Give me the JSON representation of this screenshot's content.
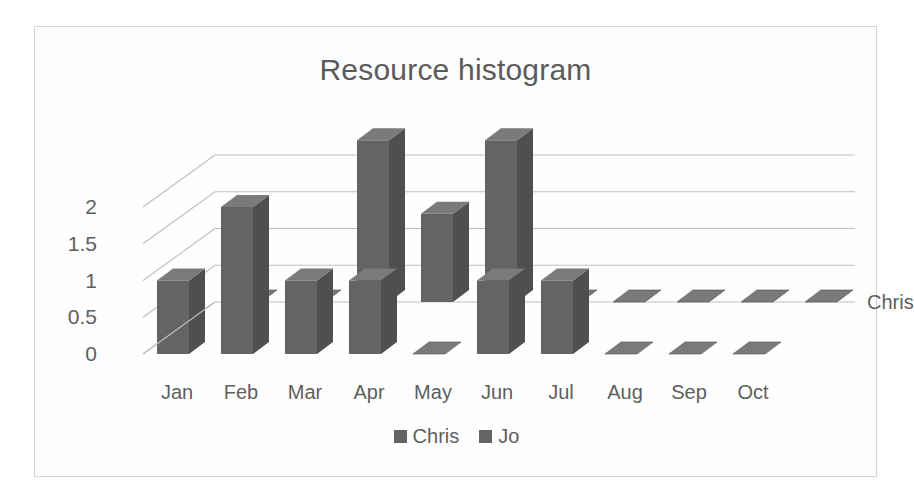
{
  "chart_data": {
    "type": "bar",
    "title": "Resource histogram",
    "subtitle": "",
    "xlabel": "",
    "ylabel": "",
    "categories": [
      "Jan",
      "Feb",
      "Mar",
      "Apr",
      "May",
      "Jun",
      "Jul",
      "Aug",
      "Sep",
      "Oct"
    ],
    "series": [
      {
        "name": "Chris",
        "values": [
          1,
          2,
          1,
          1,
          0,
          1,
          1,
          0,
          0,
          0
        ],
        "color": "#646464"
      },
      {
        "name": "Jo",
        "values": [
          0,
          0,
          2.2,
          1.2,
          2.2,
          0,
          0,
          0,
          0,
          0
        ],
        "color": "#646464"
      }
    ],
    "ytick_labels": [
      "0",
      "0.5",
      "1",
      "1.5",
      "2"
    ],
    "ytick_values": [
      0,
      0.5,
      1,
      1.5,
      2
    ],
    "ylim": [
      0,
      2.5
    ],
    "grid": true,
    "legend_position": "bottom",
    "legend_entries": [
      "Chris",
      "Jo"
    ],
    "depth_axis_label": "Chris",
    "style": "3d-clustered-column",
    "plot_background": "#ffffff",
    "grid_color": "#bfbfbf",
    "bar_face_color": "#646464",
    "bar_top_color": "#7a7a7a",
    "bar_side_color": "#4f4f4f",
    "text_color": "#5e5e5e",
    "frame_border_color": "#d4d4d4"
  }
}
